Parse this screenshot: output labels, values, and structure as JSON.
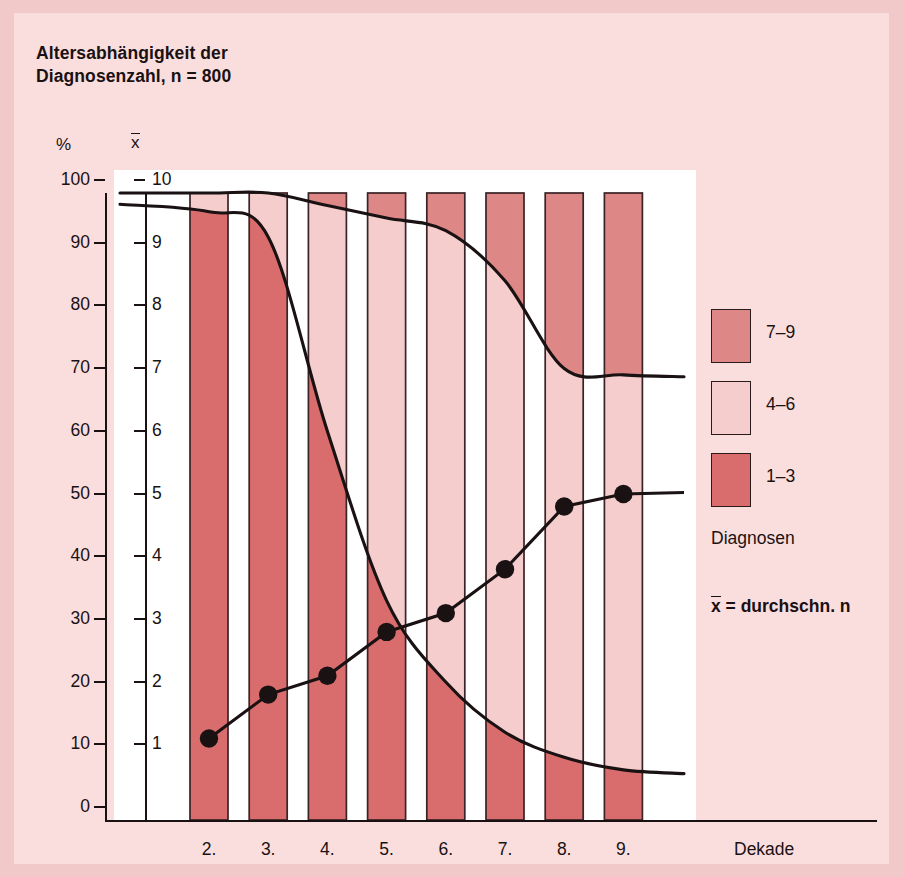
{
  "title": "Altersabhängigkeit der\nDiagnosenzahl, n = 800",
  "axes": {
    "left_header": "%",
    "right_header": "x",
    "left_ticks": [
      "100",
      "90",
      "80",
      "70",
      "60",
      "50",
      "40",
      "30",
      "20",
      "10",
      "0"
    ],
    "right_ticks": [
      "10",
      "9",
      "8",
      "7",
      "6",
      "5",
      "4",
      "3",
      "2",
      "1"
    ],
    "x_label": "Dekade",
    "x_ticks": [
      "2.",
      "3.",
      "4.",
      "5.",
      "6.",
      "7.",
      "8.",
      "9."
    ]
  },
  "legend": {
    "items": [
      {
        "label": "7–9",
        "color": "#dd8787"
      },
      {
        "label": "4–6",
        "color": "#f4cdcc"
      },
      {
        "label": "1–3",
        "color": "#d96d6d"
      }
    ],
    "caption": "Diagnosen",
    "note": "x = durchschn. n",
    "note_prefix": "x",
    "note_rest": " = durchschn. n"
  },
  "colors": {
    "page_background": "#f2c9c9",
    "panel_background": "#fadedd",
    "plot_background": "#ffffff",
    "ink": "#1a1113",
    "band_7_9": "#dd8787",
    "band_4_6": "#f4cdcc",
    "band_1_3": "#d96d6d"
  },
  "chart_data": {
    "type": "bar",
    "title": "Altersabhängigkeit der Diagnosenzahl, n = 800",
    "subtitle": "",
    "xlabel": "Dekade",
    "ylabel": "%",
    "y2label": "x",
    "ylim": [
      0,
      100
    ],
    "y2lim": [
      0,
      10
    ],
    "grid": false,
    "legend_position": "right",
    "categories": [
      "2.",
      "3.",
      "4.",
      "5.",
      "6.",
      "7.",
      "8.",
      "9."
    ],
    "stacked": true,
    "stack_order_bottom_to_top": [
      "1–3",
      "4–6",
      "7–9"
    ],
    "series": [
      {
        "name": "1–3",
        "color": "#d96d6d",
        "values": [
          97,
          93,
          62,
          35,
          22,
          14,
          10,
          8
        ]
      },
      {
        "name": "4–6",
        "color": "#f4cdcc",
        "values": [
          3,
          7,
          36,
          61,
          72,
          72,
          62,
          63
        ]
      },
      {
        "name": "7–9",
        "color": "#dd8787",
        "values": [
          0,
          0,
          2,
          4,
          6,
          14,
          28,
          29
        ]
      }
    ],
    "curves": [
      {
        "name": "cum 1–3 (%)",
        "style": "smooth-line",
        "x": [
          "2.",
          "3.",
          "4.",
          "5.",
          "6.",
          "7.",
          "8.",
          "9."
        ],
        "y": [
          97,
          93,
          62,
          35,
          22,
          14,
          10,
          8
        ]
      },
      {
        "name": "cum 1–6 (%)",
        "style": "smooth-line",
        "x": [
          "2.",
          "3.",
          "4.",
          "5.",
          "6.",
          "7.",
          "8.",
          "9."
        ],
        "y": [
          100,
          100,
          98,
          96,
          94,
          86,
          72,
          71
        ]
      }
    ],
    "markers": {
      "name": "x = durchschn. n",
      "style": "line-with-dots",
      "x": [
        "2.",
        "3.",
        "4.",
        "5.",
        "6.",
        "7.",
        "8.",
        "9."
      ],
      "y": [
        1.3,
        2.0,
        2.3,
        3.0,
        3.3,
        4.0,
        5.0,
        5.2
      ],
      "y_percent_equiv": [
        13,
        20,
        23,
        30,
        33,
        40,
        50,
        52
      ]
    }
  }
}
